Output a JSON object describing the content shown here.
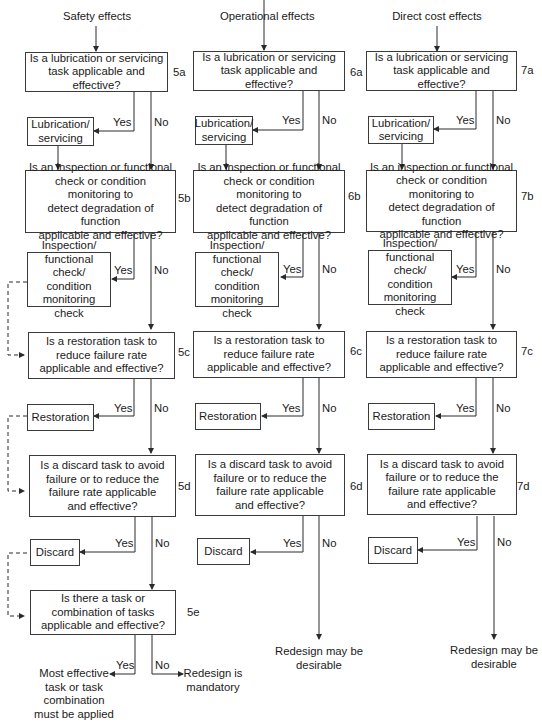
{
  "columns": [
    {
      "title": "Safety effects",
      "questions": [
        {
          "code": "5a",
          "text": "Is a lubrication or servicing\ntask applicable and effective?",
          "yes_action": "Lubrication/\nservicing"
        },
        {
          "code": "5b",
          "text": "Is an inspection or functional\ncheck or condition monitoring to\ndetect degradation of function\napplicable and effective?",
          "yes_action": "Inspection/\nfunctional check/\ncondition\nmonitoring check"
        },
        {
          "code": "5c",
          "text": "Is a restoration task to\nreduce failure rate\napplicable and effective?",
          "yes_action": "Restoration"
        },
        {
          "code": "5d",
          "text": "Is a discard task to avoid\nfailure or to reduce the\nfailure rate applicable\nand effective?",
          "yes_action": "Discard"
        },
        {
          "code": "5e",
          "text": "Is there a task or\ncombination of tasks\napplicable and effective?",
          "yes_action": "Most effective\ntask or task\ncombination\nmust be applied",
          "no_action": "Redesign is\nmandatory"
        }
      ]
    },
    {
      "title": "Operational effects",
      "questions": [
        {
          "code": "6a",
          "text": "Is a lubrication or servicing\ntask applicable and effective?",
          "yes_action": "Lubrication/\nservicing"
        },
        {
          "code": "6b",
          "text": "Is an inspection or functional\ncheck or condition monitoring to\ndetect degradation of function\napplicable and effective?",
          "yes_action": "Inspection/\nfunctional check/\ncondition\nmonitoring check"
        },
        {
          "code": "6c",
          "text": "Is a restoration task to\nreduce failure rate\napplicable and effective?",
          "yes_action": "Restoration"
        },
        {
          "code": "6d",
          "text": "Is a discard task to avoid\nfailure or to reduce the\nfailure rate applicable\nand effective?",
          "yes_action": "Discard",
          "no_action": "Redesign may be\ndesirable"
        }
      ]
    },
    {
      "title": "Direct cost effects",
      "questions": [
        {
          "code": "7a",
          "text": "Is a lubrication or servicing\ntask applicable and effective?",
          "yes_action": "Lubrication/\nservicing"
        },
        {
          "code": "7b",
          "text": "Is an inspection or functional\ncheck or condition monitoring to\ndetect degradation of function\napplicable and effective?",
          "yes_action": "Inspection/\nfunctional check/\ncondition\nmonitoring check"
        },
        {
          "code": "7c",
          "text": "Is a restoration task to\nreduce failure rate\napplicable and effective?",
          "yes_action": "Restoration"
        },
        {
          "code": "7d",
          "text": "Is a discard task to avoid\nfailure or to reduce the\nfailure rate applicable\nand effective?",
          "yes_action": "Discard",
          "no_action": "Redesign may be\ndesirable"
        }
      ]
    }
  ],
  "labels": {
    "yes": "Yes",
    "no": "No"
  },
  "colors": {
    "line": "#2a2a2a",
    "text": "#1a1a1a",
    "background": "#ffffff"
  }
}
